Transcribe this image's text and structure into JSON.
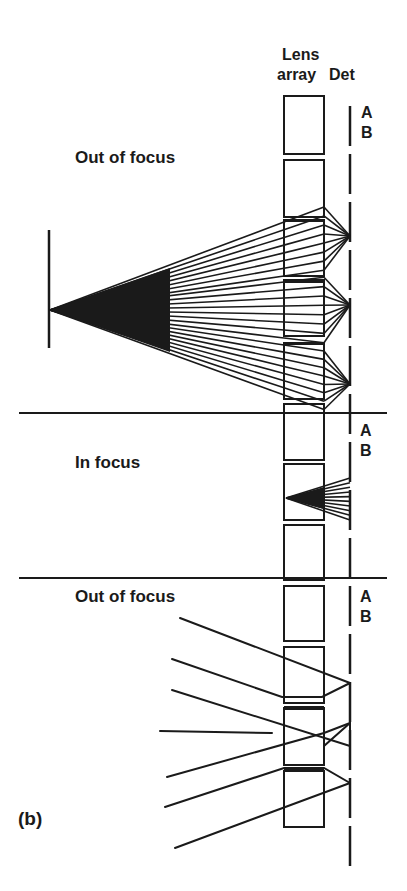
{
  "labels": {
    "lens_array_line1": "Lens",
    "lens_array_line2": "array",
    "detector": "Det",
    "section_top": "Out of focus",
    "section_middle": "In focus",
    "section_bottom": "Out of focus",
    "ab_top_a": "A",
    "ab_top_b": "B",
    "ab_mid_a": "A",
    "ab_mid_b": "B",
    "ab_bot_a": "A",
    "ab_bot_b": "B",
    "panel": "(b)"
  },
  "colors": {
    "ink": "#1a1a1a",
    "background": "#ffffff"
  },
  "geometry": {
    "lens_x": 284,
    "lens_w": 40,
    "det_x": 350,
    "lens_boxes": [
      [
        96,
        58
      ],
      [
        160,
        57
      ],
      [
        220,
        56
      ],
      [
        280,
        56
      ],
      [
        343,
        56
      ],
      [
        404,
        56
      ],
      [
        464,
        56
      ],
      [
        525,
        55
      ],
      [
        586,
        55
      ],
      [
        647,
        56
      ],
      [
        708,
        57
      ],
      [
        771,
        56
      ]
    ],
    "dividers_y": [
      413,
      578
    ],
    "object_line": {
      "x": 49,
      "y1": 230,
      "y2": 348
    },
    "cone_apex": [
      50,
      310
    ],
    "top_focus_points": [
      [
        350,
        236
      ],
      [
        350,
        305
      ],
      [
        350,
        384
      ]
    ],
    "mid_apex": [
      286,
      498
    ],
    "mid_focus_y1": 478,
    "mid_focus_y2": 520,
    "bottom_rays": [
      [
        [
          180,
          618
        ],
        [
          350,
          683
        ]
      ],
      [
        [
          172,
          659
        ],
        [
          282,
          697
        ],
        [
          322,
          697
        ],
        [
          350,
          683
        ]
      ],
      [
        [
          172,
          690
        ],
        [
          350,
          746
        ]
      ],
      [
        [
          160,
          731
        ],
        [
          272,
          733
        ]
      ],
      [
        [
          167,
          777
        ],
        [
          324,
          733
        ],
        [
          350,
          723
        ]
      ],
      [
        [
          165,
          807
        ],
        [
          284,
          768
        ],
        [
          324,
          768
        ],
        [
          350,
          783
        ]
      ],
      [
        [
          175,
          848
        ],
        [
          350,
          783
        ]
      ]
    ]
  }
}
